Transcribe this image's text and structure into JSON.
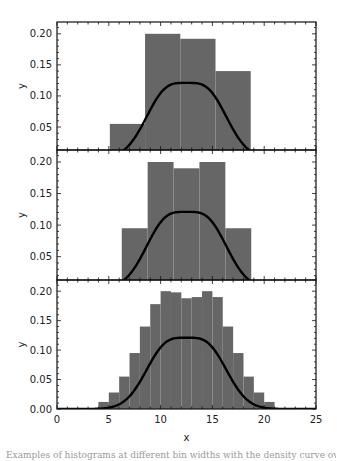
{
  "chart_data": [
    {
      "type": "bar",
      "panel": "top",
      "title": "",
      "xlabel": "",
      "ylabel": "y",
      "xlim": [
        0,
        25
      ],
      "ylim": [
        0.013,
        0.219
      ],
      "yticks": [
        0.05,
        0.1,
        0.15,
        0.2
      ],
      "ytick_labels": [
        "0.05",
        "0.10",
        "0.15",
        "0.20"
      ],
      "bin_edges": [
        5.1,
        8.5,
        11.9,
        15.3,
        18.7
      ],
      "values": [
        0.055,
        0.2,
        0.192,
        0.14
      ],
      "bar_color": "#666666",
      "curve": "density",
      "grid": false
    },
    {
      "type": "bar",
      "panel": "middle",
      "title": "",
      "xlabel": "",
      "ylabel": "y",
      "xlim": [
        0,
        25
      ],
      "ylim": [
        0.013,
        0.219
      ],
      "yticks": [
        0.05,
        0.1,
        0.15,
        0.2
      ],
      "ytick_labels": [
        "0.05",
        "0.10",
        "0.15",
        "0.20"
      ],
      "bin_edges": [
        6.25,
        8.75,
        11.25,
        13.75,
        16.25,
        18.75
      ],
      "values": [
        0.095,
        0.2,
        0.19,
        0.2,
        0.095
      ],
      "bar_color": "#666666",
      "curve": "density",
      "grid": false
    },
    {
      "type": "bar",
      "panel": "bottom",
      "title": "",
      "xlabel": "x",
      "ylabel": "y",
      "xlim": [
        0,
        25
      ],
      "ylim": [
        0.0,
        0.219
      ],
      "xticks": [
        0,
        5,
        10,
        15,
        20,
        25
      ],
      "xtick_labels": [
        "0",
        "5",
        "10",
        "15",
        "20",
        "25"
      ],
      "yticks": [
        0.0,
        0.05,
        0.1,
        0.15,
        0.2
      ],
      "ytick_labels": [
        "0.00",
        "0.05",
        "0.10",
        "0.15",
        "0.20"
      ],
      "bin_edges": [
        4,
        5,
        6,
        7,
        8,
        9,
        10,
        11,
        12,
        13,
        14,
        15,
        16,
        17,
        18,
        19,
        20,
        21
      ],
      "values": [
        0.012,
        0.028,
        0.055,
        0.095,
        0.14,
        0.178,
        0.2,
        0.198,
        0.188,
        0.19,
        0.2,
        0.19,
        0.14,
        0.095,
        0.055,
        0.028,
        0.012
      ],
      "bar_color": "#666666",
      "curve": "density",
      "grid": false
    }
  ],
  "density_curve": {
    "description": "mixture of two normals",
    "components": [
      {
        "mean": 10.5,
        "sd": 2.0,
        "weight": 0.5
      },
      {
        "mean": 14.5,
        "sd": 2.0,
        "weight": 0.5
      }
    ],
    "color": "#000000"
  },
  "labels": {
    "ylabel": "y",
    "xlabel": "x"
  },
  "caption": "Examples of histograms at different bin widths with the density curve overlaid"
}
